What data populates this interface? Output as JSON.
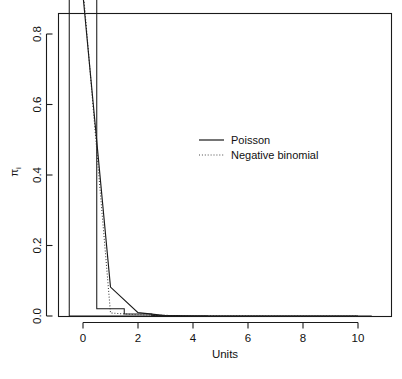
{
  "chart_data": {
    "type": "line",
    "title": "",
    "subtitle": "",
    "xlabel": "Units",
    "ylabel": "πi",
    "ylabel_base": "π",
    "ylabel_sub": "i",
    "xlim": [
      -0.5,
      10.5
    ],
    "ylim": [
      0.0,
      0.95
    ],
    "grid": false,
    "legend_position": "center-right",
    "x": [
      0,
      1,
      2,
      3,
      4,
      5,
      6,
      7,
      8,
      9,
      10
    ],
    "xticks": [
      0,
      2,
      4,
      6,
      8,
      10
    ],
    "xticklabels": [
      "0",
      "2",
      "4",
      "6",
      "8",
      "10"
    ],
    "yticks": [
      0.0,
      0.2,
      0.4,
      0.6,
      0.8
    ],
    "yticklabels": [
      "0.0",
      "0.2",
      "0.4",
      "0.6",
      "0.8"
    ],
    "series": [
      {
        "name": "Poisson",
        "style": "solid",
        "color": "#1a1a1a",
        "values": [
          0.91,
          0.082,
          0.0095,
          0.001,
          0.0001,
          0.0,
          0.0,
          0.0,
          0.0,
          0.0,
          0.0
        ]
      },
      {
        "name": "Negative binomial",
        "style": "dotted",
        "color": "#3a3a3a",
        "values": [
          0.932,
          0.0085,
          0.0035,
          0.0018,
          0.001,
          0.0006,
          0.0004,
          0.0002,
          0.0001,
          0.0001,
          0.0
        ]
      }
    ],
    "histogram": {
      "name": "Observed frequencies",
      "style": "step-outline",
      "color": "#1a1a1a",
      "bin_centers": [
        0,
        1,
        2,
        3,
        4,
        5,
        6,
        7,
        8,
        9,
        10
      ],
      "bin_width": 1,
      "values": [
        0.941,
        0.0205,
        0.0055,
        0.0012,
        0.0004,
        0.0,
        0.0,
        0.0,
        0.0,
        0.0,
        0.0
      ]
    },
    "legend": [
      {
        "label": "Poisson",
        "style": "solid"
      },
      {
        "label": "Negative binomial",
        "style": "dotted"
      }
    ]
  }
}
